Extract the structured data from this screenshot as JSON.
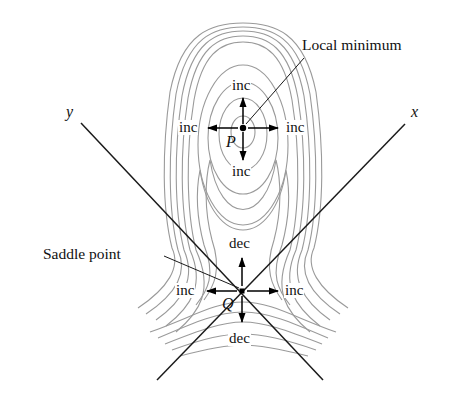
{
  "figure": {
    "callouts": {
      "local_minimum": "Local minimum",
      "saddle_point": "Saddle point"
    },
    "axes": {
      "x_label": "x",
      "y_label": "y"
    },
    "points": {
      "P": {
        "label": "P",
        "type": "local minimum"
      },
      "Q": {
        "label": "Q",
        "type": "saddle point"
      }
    },
    "directions_at_P": {
      "up": "inc",
      "down": "inc",
      "left": "inc",
      "right": "inc"
    },
    "directions_at_Q": {
      "up": "dec",
      "down": "dec",
      "left": "inc",
      "right": "inc"
    },
    "colors": {
      "contour": "#9a9a9a",
      "ink": "#1a1a1a",
      "background": "#ffffff"
    }
  }
}
